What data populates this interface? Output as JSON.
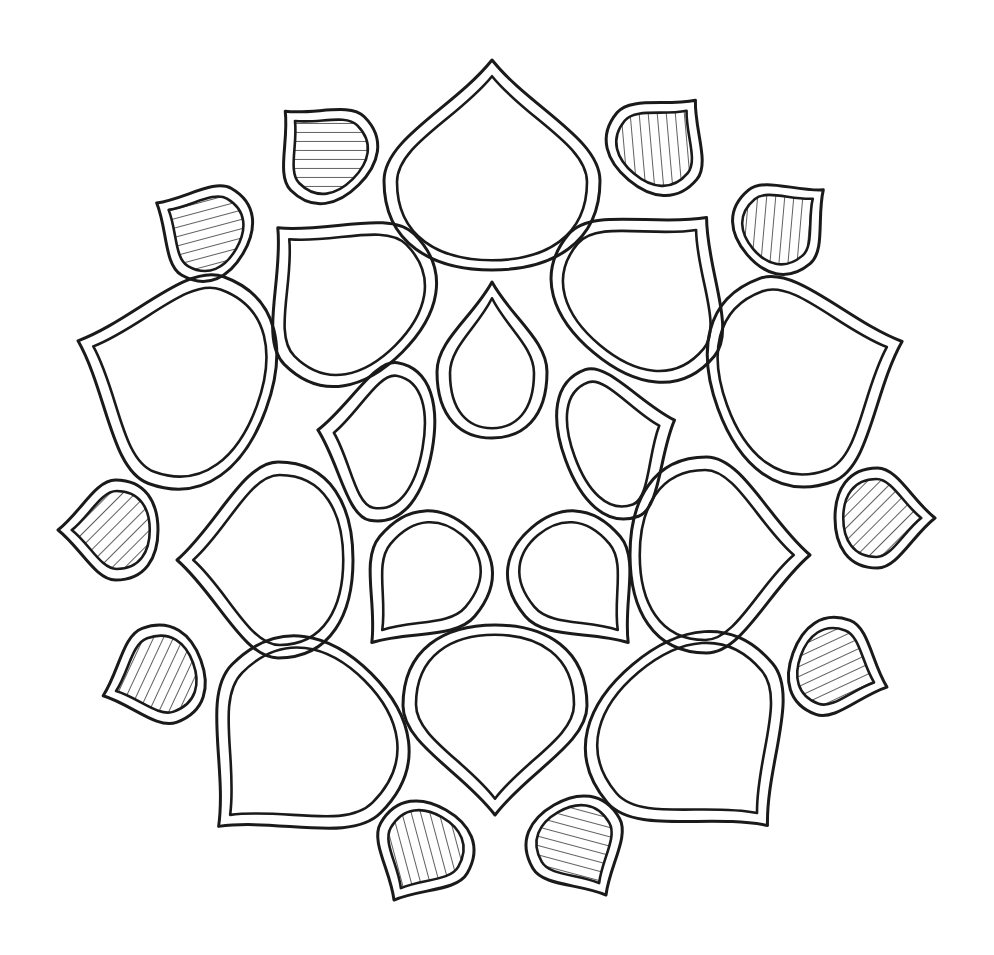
{
  "illustration": {
    "title": "",
    "description": "Hand-drawn mandala of double-outlined teardrop shapes; small outer drops are hatched",
    "stroke_color": "#1a1a1a",
    "background_color": "#ffffff",
    "hatch_color": "#1a1a1a",
    "shapes": [
      {
        "kind": "large",
        "cx": 492,
        "cy": 165,
        "rx": 108,
        "ry": 105,
        "rot": 180,
        "hatched": false
      },
      {
        "kind": "large",
        "cx": 340,
        "cy": 290,
        "rx": 92,
        "ry": 88,
        "rot": 135,
        "hatched": false
      },
      {
        "kind": "large",
        "cx": 650,
        "cy": 285,
        "rx": 95,
        "ry": 88,
        "rot": 220,
        "hatched": false
      },
      {
        "kind": "large",
        "cx": 172,
        "cy": 375,
        "rx": 110,
        "ry": 100,
        "rot": 110,
        "hatched": false
      },
      {
        "kind": "large",
        "cx": 810,
        "cy": 375,
        "rx": 108,
        "ry": 98,
        "rot": 250,
        "hatched": false
      },
      {
        "kind": "large",
        "cx": 265,
        "cy": 560,
        "rx": 98,
        "ry": 88,
        "rot": 90,
        "hatched": false
      },
      {
        "kind": "large",
        "cx": 720,
        "cy": 555,
        "rx": 98,
        "ry": 90,
        "rot": 270,
        "hatched": false
      },
      {
        "kind": "large",
        "cx": 295,
        "cy": 750,
        "rx": 105,
        "ry": 108,
        "rot": 45,
        "hatched": false
      },
      {
        "kind": "large",
        "cx": 700,
        "cy": 745,
        "rx": 108,
        "ry": 105,
        "rot": 320,
        "hatched": false
      },
      {
        "kind": "large",
        "cx": 495,
        "cy": 720,
        "rx": 92,
        "ry": 95,
        "rot": 0,
        "hatched": false
      },
      {
        "kind": "inner",
        "cx": 492,
        "cy": 360,
        "rx": 55,
        "ry": 78,
        "rot": 180,
        "hatched": false
      },
      {
        "kind": "inner",
        "cx": 375,
        "cy": 440,
        "rx": 80,
        "ry": 58,
        "rot": 100,
        "hatched": false
      },
      {
        "kind": "inner",
        "cx": 620,
        "cy": 440,
        "rx": 78,
        "ry": 58,
        "rot": 250,
        "hatched": false
      },
      {
        "kind": "inner",
        "cx": 420,
        "cy": 585,
        "rx": 62,
        "ry": 75,
        "rot": 40,
        "hatched": false
      },
      {
        "kind": "inner",
        "cx": 580,
        "cy": 585,
        "rx": 62,
        "ry": 75,
        "rot": 320,
        "hatched": false
      },
      {
        "kind": "small",
        "cx": 322,
        "cy": 148,
        "rx": 52,
        "ry": 52,
        "rot": 135,
        "hatched": true
      },
      {
        "kind": "small",
        "cx": 662,
        "cy": 140,
        "rx": 52,
        "ry": 52,
        "rot": 220,
        "hatched": true
      },
      {
        "kind": "small",
        "cx": 200,
        "cy": 228,
        "rx": 50,
        "ry": 50,
        "rot": 120,
        "hatched": true
      },
      {
        "kind": "small",
        "cx": 785,
        "cy": 222,
        "rx": 48,
        "ry": 50,
        "rot": 230,
        "hatched": true
      },
      {
        "kind": "small",
        "cx": 108,
        "cy": 530,
        "rx": 50,
        "ry": 50,
        "rot": 90,
        "hatched": true
      },
      {
        "kind": "small",
        "cx": 885,
        "cy": 518,
        "rx": 50,
        "ry": 50,
        "rot": 270,
        "hatched": true
      },
      {
        "kind": "small",
        "cx": 152,
        "cy": 678,
        "rx": 50,
        "ry": 52,
        "rot": 70,
        "hatched": true
      },
      {
        "kind": "small",
        "cx": 840,
        "cy": 670,
        "rx": 50,
        "ry": 50,
        "rot": 290,
        "hatched": true
      },
      {
        "kind": "small",
        "cx": 420,
        "cy": 855,
        "rx": 50,
        "ry": 52,
        "rot": 30,
        "hatched": true
      },
      {
        "kind": "small",
        "cx": 580,
        "cy": 850,
        "rx": 50,
        "ry": 52,
        "rot": 330,
        "hatched": true
      }
    ]
  }
}
